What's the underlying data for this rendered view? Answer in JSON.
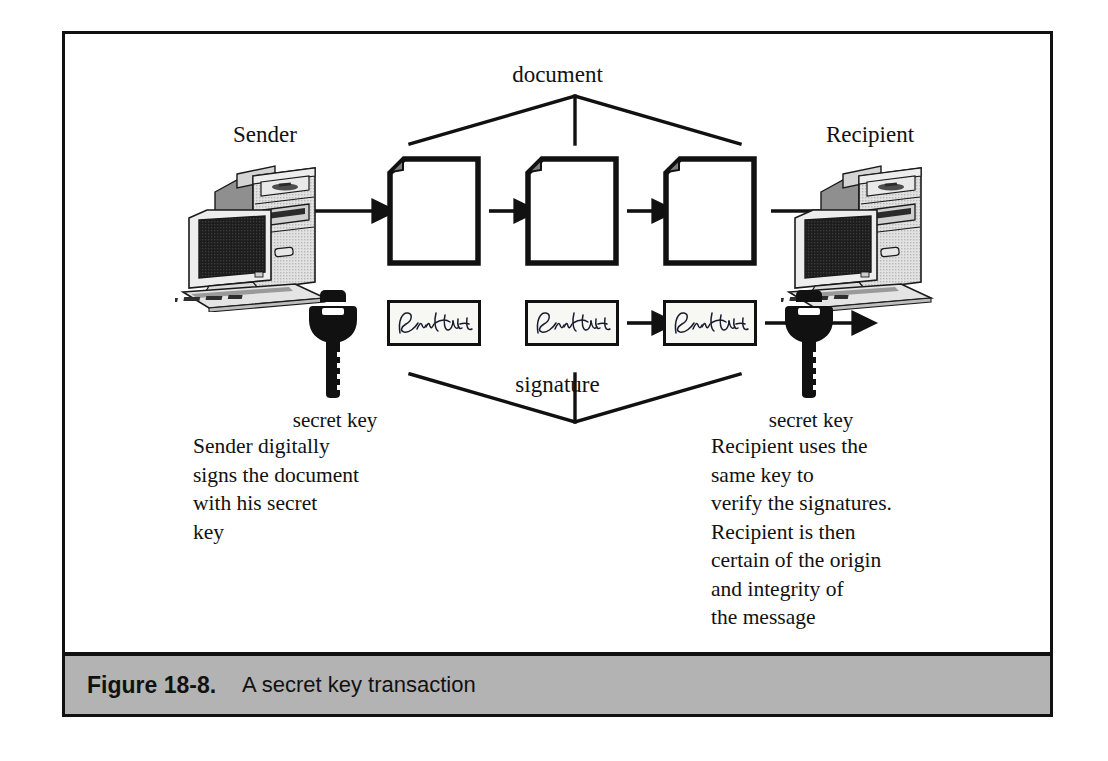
{
  "figure": {
    "caption_number": "Figure 18-8.",
    "caption_text": "A secret key transaction",
    "caption_bar_color": "#b3b3b3",
    "frame_color": "#111111"
  },
  "diagram": {
    "type": "flow-diagram",
    "top_bracket_label": "document",
    "bottom_bracket_label": "signature",
    "endpoints": [
      {
        "name": "sender",
        "label": "Sender",
        "icon": "desktop-computer-icon"
      },
      {
        "name": "recipient",
        "label": "Recipient",
        "icon": "desktop-computer-icon"
      }
    ],
    "keys": [
      {
        "name": "sender-key",
        "label": "secret key",
        "icon": "key-icon"
      },
      {
        "name": "recipient-key",
        "label": "secret key",
        "icon": "key-icon"
      }
    ],
    "pages": [
      {
        "name": "page-1",
        "icon": "document-page-icon"
      },
      {
        "name": "page-2",
        "icon": "document-page-icon"
      },
      {
        "name": "page-3",
        "icon": "document-page-icon"
      }
    ],
    "signature_boxes": [
      {
        "name": "signature-box-1",
        "icon": "handwritten-signature-icon"
      },
      {
        "name": "signature-box-2",
        "icon": "handwritten-signature-icon"
      },
      {
        "name": "signature-box-3",
        "icon": "handwritten-signature-icon"
      }
    ],
    "arrows": [
      "sender-to-page-1",
      "page-1-to-page-2",
      "page-2-to-page-3",
      "page-3-to-recipient",
      "signature-2-to-signature-3",
      "recipient-key-to-recipient"
    ],
    "sender_description": [
      "Sender digitally",
      "signs the document",
      "with his secret",
      "key"
    ],
    "recipient_description": [
      "Recipient uses the",
      "same key to",
      "verify the signatures.",
      "Recipient is then",
      "certain of the origin",
      "and integrity of",
      "the message"
    ]
  }
}
